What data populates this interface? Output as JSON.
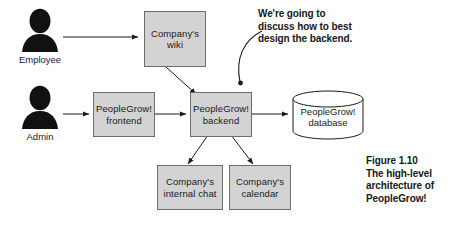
{
  "figure": {
    "caption_lines": [
      "Figure 1.10",
      "The high-level",
      "architecture of",
      "PeopleGrow!"
    ]
  },
  "callout": {
    "lines": [
      "We're going to",
      "discuss how to best",
      "design the backend."
    ]
  },
  "actors": [
    {
      "name": "employee",
      "label": "Employee",
      "icon": "person-icon"
    },
    {
      "name": "admin",
      "label": "Admin",
      "icon": "person-icon"
    }
  ],
  "nodes": [
    {
      "name": "company-wiki",
      "line1": "Company's",
      "line2": "wiki"
    },
    {
      "name": "peoplegrow-frontend",
      "line1": "PeopleGrow!",
      "line2": "frontend"
    },
    {
      "name": "peoplegrow-backend",
      "line1": "PeopleGrow!",
      "line2": "backend"
    },
    {
      "name": "company-internal-chat",
      "line1": "Company's",
      "line2": "internal chat"
    },
    {
      "name": "company-calendar",
      "line1": "Company's",
      "line2": "calendar"
    }
  ],
  "database": {
    "line1": "PeopleGrow!",
    "line2": "database"
  },
  "colors": {
    "node_fill": "#d3d3d3",
    "node_border": "#6e6e6e",
    "stroke": "#1a1a1a",
    "background": "#ffffff"
  }
}
